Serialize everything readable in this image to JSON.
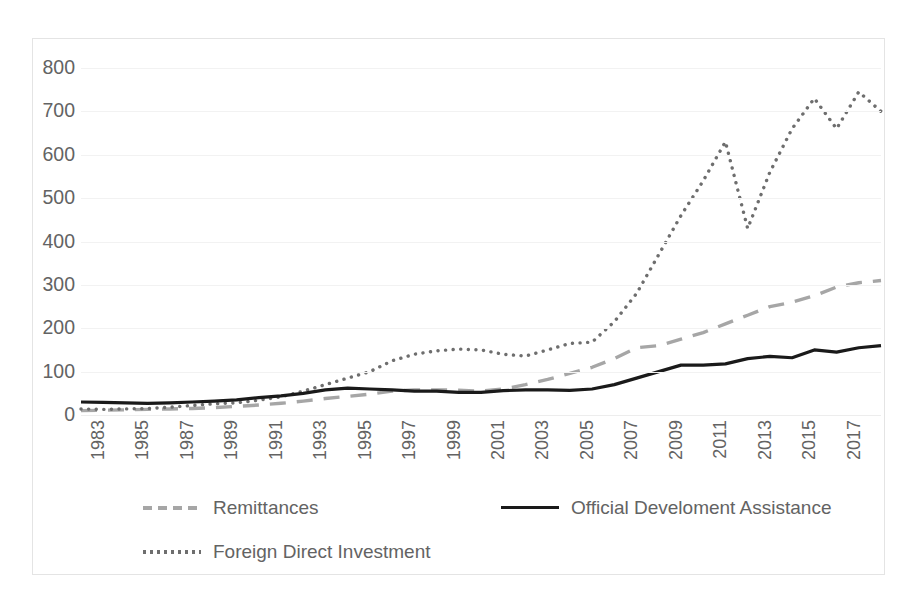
{
  "chart_data": {
    "type": "line",
    "title": "",
    "subtitle": "",
    "xlabel": "",
    "ylabel": "",
    "ylim": [
      0,
      800
    ],
    "ytick_step": 100,
    "yticks": [
      "800",
      "700",
      "600",
      "500",
      "400",
      "300",
      "200",
      "100",
      "0"
    ],
    "grid": true,
    "legend_position": "bottom",
    "x": [
      1983,
      1984,
      1985,
      1986,
      1987,
      1988,
      1989,
      1990,
      1991,
      1992,
      1993,
      1994,
      1995,
      1996,
      1997,
      1998,
      1999,
      2000,
      2001,
      2002,
      2003,
      2004,
      2005,
      2006,
      2007,
      2008,
      2009,
      2010,
      2011,
      2012,
      2013,
      2014,
      2015,
      2016,
      2017,
      2018,
      2019
    ],
    "xtick_labels": [
      "1983",
      "1985",
      "1987",
      "1989",
      "1991",
      "1993",
      "1995",
      "1997",
      "1999",
      "2001",
      "2003",
      "2005",
      "2007",
      "2009",
      "2011",
      "2013",
      "2015",
      "2017"
    ],
    "series": [
      {
        "name": "Remittances",
        "style": "dashed",
        "color": "#a6a6a6",
        "values": [
          10,
          11,
          12,
          13,
          14,
          15,
          17,
          20,
          23,
          27,
          32,
          38,
          43,
          48,
          55,
          58,
          58,
          57,
          55,
          60,
          70,
          82,
          96,
          110,
          130,
          155,
          160,
          175,
          190,
          210,
          230,
          250,
          260,
          275,
          295,
          305,
          310
        ]
      },
      {
        "name": "Foreign Direct Investment",
        "style": "dotted",
        "color": "#6e6e6e",
        "values": [
          14,
          13,
          14,
          15,
          18,
          22,
          26,
          28,
          34,
          42,
          55,
          70,
          85,
          100,
          125,
          140,
          148,
          152,
          150,
          140,
          136,
          150,
          165,
          168,
          215,
          280,
          370,
          460,
          540,
          630,
          430,
          560,
          660,
          730,
          660,
          745,
          700
        ]
      },
      {
        "name": "Official Develoment Assistance",
        "style": "solid",
        "color": "#1a1a1a",
        "values": [
          30,
          29,
          28,
          27,
          28,
          30,
          32,
          35,
          40,
          44,
          50,
          58,
          62,
          60,
          58,
          55,
          55,
          52,
          52,
          56,
          58,
          58,
          57,
          60,
          70,
          85,
          100,
          115,
          115,
          118,
          130,
          135,
          132,
          150,
          145,
          155,
          160
        ]
      }
    ]
  },
  "legend": {
    "items": [
      {
        "label": "Remittances",
        "style": "dashed",
        "color": "#a6a6a6"
      },
      {
        "label": "Foreign Direct Investment",
        "style": "dotted",
        "color": "#6e6e6e"
      },
      {
        "label": "Official Develoment Assistance",
        "style": "solid",
        "color": "#1a1a1a"
      }
    ]
  }
}
